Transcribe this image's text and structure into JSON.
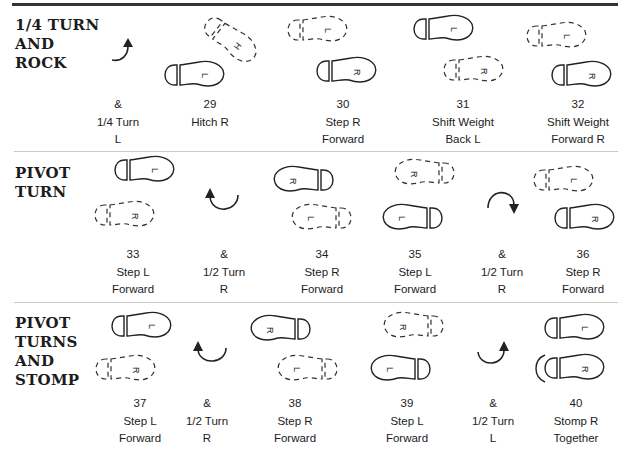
{
  "sections": [
    {
      "title": "1/4 TURN\nAND\nROCK",
      "steps": [
        {
          "count": "&",
          "text": "&\n1/4 Turn\nL"
        },
        {
          "count": "29",
          "text": "29\nHitch R"
        },
        {
          "count": "30",
          "text": "30\nStep R\nForward"
        },
        {
          "count": "31",
          "text": "31\nShift Weight\nBack L"
        },
        {
          "count": "32",
          "text": "32\nShift Weight\nForward R"
        }
      ]
    },
    {
      "title": "PIVOT\nTURN",
      "steps": [
        {
          "count": "33",
          "text": "33\nStep L\nForward"
        },
        {
          "count": "&",
          "text": "&\n1/2 Turn\nR"
        },
        {
          "count": "34",
          "text": "34\nStep R\nForward"
        },
        {
          "count": "35",
          "text": "35\nStep L\nForward"
        },
        {
          "count": "&",
          "text": "&\n1/2 Turn\nR"
        },
        {
          "count": "36",
          "text": "36\nStep R\nForward"
        }
      ]
    },
    {
      "title": "PIVOT\nTURNS\nAND\nSTOMP",
      "steps": [
        {
          "count": "37",
          "text": "37\nStep L\nForward"
        },
        {
          "count": "&",
          "text": "&\n1/2 Turn\nR"
        },
        {
          "count": "38",
          "text": "38\nStep R\nForward"
        },
        {
          "count": "39",
          "text": "39\nStep L\nForward"
        },
        {
          "count": "&",
          "text": "&\n1/2 Turn\nL"
        },
        {
          "count": "40",
          "text": "40\nStomp R\nTogether"
        }
      ]
    }
  ],
  "glyphs": {
    "left": "L",
    "right": "R",
    "hitch": "H"
  },
  "legend": {
    "solid_foot": "weight on foot",
    "dashed_foot": "no weight / previous position"
  },
  "colors": {
    "ink": "#222222",
    "rule": "#333333",
    "divider": "#c8c8c8",
    "background": "#ffffff"
  }
}
